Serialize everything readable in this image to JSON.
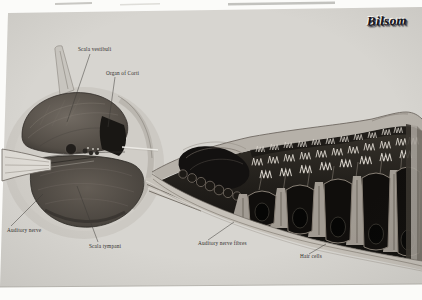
{
  "brand": {
    "logo_text": "Bilsom"
  },
  "figure": {
    "labels": {
      "scala_vestibuli": "Scala vestibuli",
      "organ_of_corti": "Organ of Corti",
      "auditory_nerve": "Auditory nerve",
      "scala_tympani": "Scala tympani",
      "auditory_nerve_fibres": "Auditory nerve fibres",
      "hair_cells": "Hair cells"
    }
  },
  "colors": {
    "page_bg": "#fbfbf9",
    "panel_bg": "#d7d5d0",
    "ink": "#312f2c",
    "logo_ink": "#15151d",
    "illustration_dark": "#14120f",
    "illustration_mid": "#6e6760",
    "highlight": "#d3cec6"
  }
}
